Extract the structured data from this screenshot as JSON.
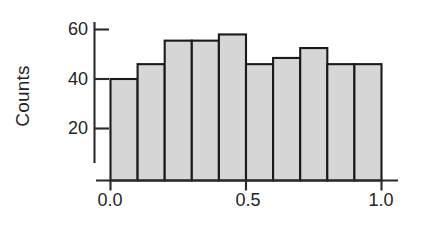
{
  "chart_data": {
    "type": "bar",
    "subtype": "histogram",
    "title": "",
    "xlabel": "",
    "ylabel": "Counts",
    "categories": [
      "0.0-0.1",
      "0.1-0.2",
      "0.2-0.3",
      "0.3-0.4",
      "0.4-0.5",
      "0.5-0.6",
      "0.6-0.7",
      "0.7-0.8",
      "0.8-0.9",
      "0.9-1.0"
    ],
    "bin_edges": [
      0.0,
      0.1,
      0.2,
      0.3,
      0.4,
      0.5,
      0.6,
      0.7,
      0.8,
      0.9,
      1.0
    ],
    "values": [
      40,
      46,
      55.5,
      55.5,
      58,
      46,
      48.5,
      52.5,
      46,
      46
    ],
    "bin_width": 0.1,
    "xlim": [
      0.0,
      1.0
    ],
    "ylim": [
      0,
      63
    ],
    "xticks": [
      0.0,
      0.5,
      1.0
    ],
    "xtick_labels": [
      "0.0",
      "0.5",
      "1.0"
    ],
    "yticks": [
      20,
      40,
      60
    ],
    "ytick_labels": [
      "20",
      "40",
      "60"
    ],
    "grid": false,
    "legend": null,
    "bar_fill_color": "#d6d6d6",
    "bar_edge_color": "#1a1a1a",
    "axis_color": "#2a2a2a",
    "text_color": "#242424"
  },
  "axes": {
    "y_axis_title": "Counts",
    "y_tick_0": "20",
    "y_tick_1": "40",
    "y_tick_2": "60",
    "x_tick_0": "0.0",
    "x_tick_1": "0.5",
    "x_tick_2": "1.0"
  }
}
